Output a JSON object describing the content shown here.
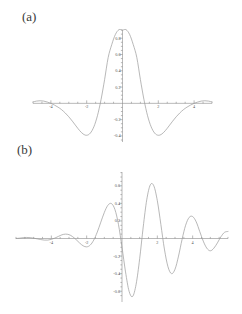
{
  "figure": {
    "background": "#ffffff",
    "curve_color": "#9a9a9a",
    "axis_color": "#8a8a8a",
    "label_color": "#555555"
  },
  "panels": {
    "a": {
      "label": "(a)"
    },
    "b": {
      "label": "(b)"
    }
  },
  "chart_data": [
    {
      "type": "line",
      "panel": "(a)",
      "title": "",
      "xlabel": "",
      "ylabel": "",
      "xlim": [
        -5.0,
        5.0
      ],
      "ylim": [
        -0.45,
        0.95
      ],
      "grid": false,
      "legend": null,
      "xticks": [
        -4,
        -2,
        2,
        4
      ],
      "xtick_labels": [
        "-4",
        "-2",
        "2",
        "4"
      ],
      "yticks": [
        -0.4,
        -0.2,
        0.2,
        0.4,
        0.6,
        0.8
      ],
      "ytick_labels": [
        "-0.4",
        "-0.2",
        "0.2",
        "0.4",
        "0.6",
        "0.8"
      ],
      "description": "sinc-like symmetric pulse, single central maximum with two negative side lobes",
      "peak_value": 0.9,
      "peak_x": 0.0,
      "minimum_value": -0.39,
      "minimum_x": [
        -2.5,
        2.5
      ],
      "zero_crossings": [
        -1.45,
        1.45,
        -4.05,
        4.05
      ],
      "x": [
        -5.0,
        -4.8,
        -4.6,
        -4.4,
        -4.2,
        -4.0,
        -3.8,
        -3.6,
        -3.4,
        -3.2,
        -3.0,
        -2.8,
        -2.6,
        -2.4,
        -2.2,
        -2.0,
        -1.8,
        -1.6,
        -1.4,
        -1.2,
        -1.0,
        -0.8,
        -0.6,
        -0.4,
        -0.2,
        0.0,
        0.2,
        0.4,
        0.6,
        0.8,
        1.0,
        1.2,
        1.4,
        1.6,
        1.8,
        2.0,
        2.2,
        2.4,
        2.6,
        2.8,
        3.0,
        3.2,
        3.4,
        3.6,
        3.8,
        4.0,
        4.2,
        4.4,
        4.6,
        4.8,
        5.0
      ],
      "y": [
        0.018,
        0.028,
        0.032,
        0.028,
        0.016,
        0.0,
        -0.021,
        -0.047,
        -0.078,
        -0.118,
        -0.165,
        -0.219,
        -0.277,
        -0.333,
        -0.376,
        -0.392,
        -0.366,
        -0.288,
        -0.152,
        0.045,
        0.292,
        0.563,
        0.722,
        0.845,
        0.905,
        0.9,
        0.905,
        0.845,
        0.722,
        0.563,
        0.292,
        0.045,
        -0.152,
        -0.288,
        -0.366,
        -0.392,
        -0.376,
        -0.333,
        -0.277,
        -0.219,
        -0.165,
        -0.118,
        -0.078,
        -0.047,
        -0.021,
        0.0,
        0.016,
        0.028,
        0.032,
        0.028,
        0.018
      ]
    },
    {
      "type": "line",
      "panel": "(b)",
      "title": "",
      "xlabel": "",
      "ylabel": "",
      "xlim": [
        -6.0,
        6.0
      ],
      "ylim": [
        -0.7,
        0.78
      ],
      "grid": false,
      "legend": null,
      "xticks": [
        -4,
        -2,
        2,
        4
      ],
      "xtick_labels": [
        "-4",
        "-2",
        "2",
        "4"
      ],
      "yticks": [
        -0.6,
        -0.4,
        -0.2,
        0.2,
        0.4,
        0.6
      ],
      "ytick_labels": [
        "-0.6",
        "-0.4",
        "-0.2",
        "0.2",
        "0.4",
        "0.6"
      ],
      "description": "rapidly oscillating wave packet with decaying envelope, large central peak",
      "peak_value": 0.75,
      "peak_x": 0.0,
      "envelope_peaks": [
        0.75,
        0.62,
        0.38,
        0.08,
        0.02
      ],
      "x": [
        -6.0,
        -5.8,
        -5.6,
        -5.4,
        -5.2,
        -5.0,
        -4.8,
        -4.6,
        -4.4,
        -4.2,
        -4.0,
        -3.8,
        -3.6,
        -3.4,
        -3.2,
        -3.0,
        -2.8,
        -2.6,
        -2.4,
        -2.2,
        -2.0,
        -1.8,
        -1.6,
        -1.4,
        -1.2,
        -1.0,
        -0.8,
        -0.6,
        -0.4,
        -0.2,
        0.0,
        0.2,
        0.4,
        0.6,
        0.8,
        1.0,
        1.2,
        1.4,
        1.6,
        1.8,
        2.0,
        2.2,
        2.4,
        2.6,
        2.8,
        3.0,
        3.2,
        3.4,
        3.6,
        3.8,
        4.0,
        4.2,
        4.4,
        4.6,
        4.8,
        5.0,
        5.2,
        5.4,
        5.6,
        5.8,
        6.0
      ],
      "y": [
        0.0,
        0.004,
        0.009,
        0.012,
        0.01,
        0.004,
        -0.004,
        -0.012,
        -0.018,
        -0.018,
        -0.01,
        0.005,
        0.024,
        0.042,
        0.05,
        0.044,
        0.022,
        -0.012,
        -0.051,
        -0.083,
        -0.095,
        -0.075,
        -0.018,
        0.073,
        0.186,
        0.297,
        0.378,
        0.398,
        0.33,
        0.16,
        -0.1,
        -0.38,
        -0.6,
        -0.66,
        -0.52,
        -0.23,
        0.13,
        0.44,
        0.61,
        0.6,
        0.43,
        0.16,
        -0.12,
        -0.32,
        -0.4,
        -0.35,
        -0.2,
        -0.01,
        0.15,
        0.24,
        0.25,
        0.19,
        0.08,
        -0.03,
        -0.11,
        -0.14,
        -0.11,
        -0.05,
        0.02,
        0.07,
        0.08
      ]
    }
  ]
}
